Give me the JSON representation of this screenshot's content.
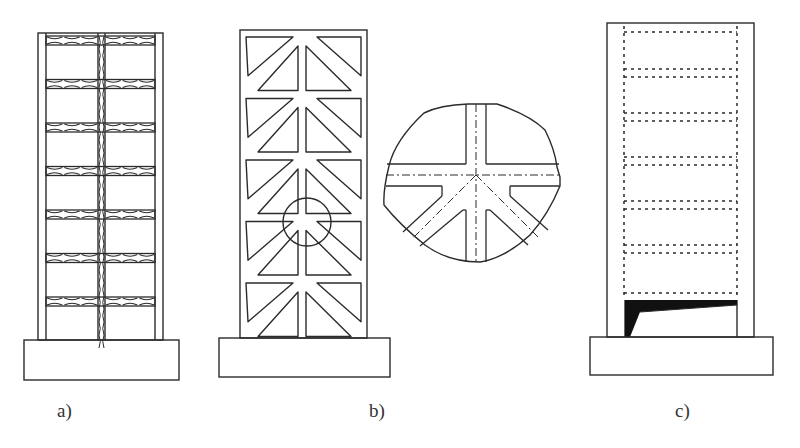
{
  "figure": {
    "panels": [
      {
        "id": "a",
        "label": "a)",
        "description": "Coupled shear wall with diagonally reinforced (X-pattern) coupling beams and central spine",
        "floors": 7
      },
      {
        "id": "b",
        "label": "b)",
        "description": "Wall with diagonal bracing forming triangular openings, with magnified joint detail",
        "panels": 5,
        "detail_view": "enlarged joint showing centerlines (dash-dot)"
      },
      {
        "id": "c",
        "label": "c)",
        "description": "Wall with dotted frame outlines and crack/failure wedge at base",
        "floors": 7
      }
    ]
  },
  "colors": {
    "line": "#2b2b2b",
    "background": "#ffffff",
    "label": "#333333",
    "crack": "#111111"
  }
}
